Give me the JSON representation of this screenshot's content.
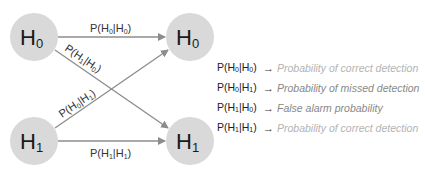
{
  "nodes": [
    {
      "id": "h0_left",
      "main": "H",
      "sub": "0",
      "cx": 34,
      "cy": 37
    },
    {
      "id": "h0_right",
      "main": "H",
      "sub": "0",
      "cx": 190,
      "cy": 37
    },
    {
      "id": "h1_left",
      "main": "H",
      "sub": "1",
      "cx": 34,
      "cy": 141
    },
    {
      "id": "h1_right",
      "main": "H",
      "sub": "1",
      "cx": 190,
      "cy": 141
    }
  ],
  "edges": [
    {
      "id": "h0_to_h0",
      "label": "P(H|H)",
      "parts": [
        "P(H",
        "0",
        "|H",
        "0",
        ")"
      ]
    },
    {
      "id": "h0_to_h1",
      "parts": [
        "P(H",
        "1",
        "|H",
        "0",
        ")"
      ]
    },
    {
      "id": "h1_to_h0",
      "parts": [
        "P(H",
        "0",
        "|H",
        "1",
        ")"
      ]
    },
    {
      "id": "h1_to_h1",
      "parts": [
        "P(H",
        "1",
        "|H",
        "1",
        ")"
      ]
    }
  ],
  "legend": [
    {
      "key": [
        "P(H",
        "0",
        "|H",
        "0",
        ")"
      ],
      "arrow": "→",
      "desc": "Probability of  correct detection",
      "tone": "light"
    },
    {
      "key": [
        "P(H",
        "0",
        "|H",
        "1",
        ")"
      ],
      "arrow": "→",
      "desc": "Probability of  missed detection",
      "tone": "dark"
    },
    {
      "key": [
        "P(H",
        "1",
        "|H",
        "0",
        ")"
      ],
      "arrow": "→",
      "desc": "False alarm probability",
      "tone": "dark"
    },
    {
      "key": [
        "P(H",
        "1",
        "|H",
        "1",
        ")"
      ],
      "arrow": "→",
      "desc": "Probability of  correct detection",
      "tone": "light"
    }
  ],
  "colors": {
    "node_fill": "#d9d9d9",
    "edge": "#8c8c8c",
    "desc_light": "#b3b3b3",
    "desc_dark": "#888888"
  }
}
